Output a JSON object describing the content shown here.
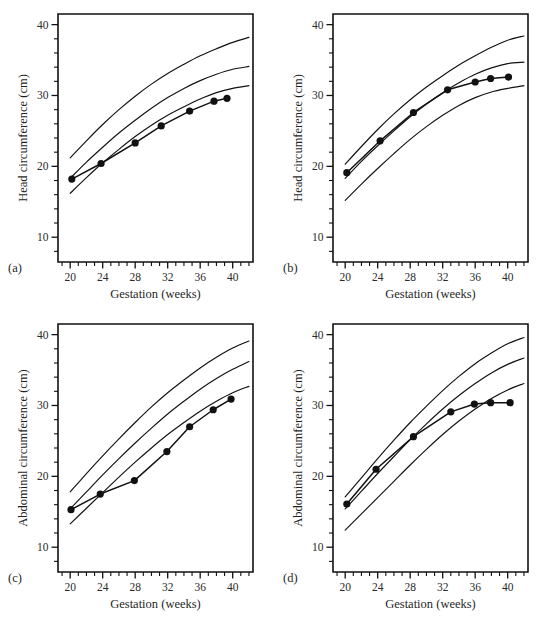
{
  "figure": {
    "background": "#ffffff",
    "ink_color": "#111111"
  },
  "axes": {
    "x_title": "Gestation (weeks)",
    "x_ticks": [
      20,
      24,
      28,
      32,
      36,
      40
    ],
    "x_min": 18.5,
    "x_max": 42.5,
    "y_ticks": [
      10,
      20,
      30,
      40
    ],
    "y_min": 6.5,
    "y_max": 41.5,
    "y_title_head": "Head circumference (cm)",
    "y_title_abdo": "Abdominal circumference (cm)"
  },
  "panels": [
    {
      "key": "a",
      "label": "(a)",
      "ylabel": "Head circumference (cm)",
      "xlabel": "Gestation (weeks)"
    },
    {
      "key": "b",
      "label": "(b)",
      "ylabel": "Head circumference (cm)",
      "xlabel": "Gestation (weeks)"
    },
    {
      "key": "c",
      "label": "(c)",
      "ylabel": "Abdominal circumference (cm)",
      "xlabel": "Gestation (weeks)"
    },
    {
      "key": "d",
      "label": "(d)",
      "ylabel": "Abdominal circumference (cm)",
      "xlabel": "Gestation (weeks)"
    }
  ],
  "chart_data": [
    {
      "type": "line",
      "panel": "a",
      "title": "(a)",
      "xlabel": "Gestation (weeks)",
      "ylabel": "Head circumference (cm)",
      "xlim": [
        18.5,
        42.5
      ],
      "ylim": [
        6.5,
        41.5
      ],
      "xticks": [
        20,
        24,
        28,
        32,
        36,
        40
      ],
      "yticks": [
        10,
        20,
        30,
        40
      ],
      "grid": false,
      "legend": "none",
      "series": [
        {
          "name": "upper centile",
          "kind": "reference-curve",
          "x": [
            20,
            22,
            24,
            26,
            28,
            30,
            32,
            34,
            36,
            38,
            40,
            42
          ],
          "values": [
            21.2,
            23.6,
            25.9,
            28.0,
            29.9,
            31.6,
            33.1,
            34.4,
            35.6,
            36.6,
            37.5,
            38.2
          ]
        },
        {
          "name": "middle centile",
          "kind": "reference-curve",
          "x": [
            20,
            22,
            24,
            26,
            28,
            30,
            32,
            34,
            36,
            38,
            40,
            42
          ],
          "values": [
            18.3,
            20.6,
            22.7,
            24.7,
            26.5,
            28.2,
            29.7,
            31.0,
            32.1,
            33.0,
            33.7,
            34.1
          ]
        },
        {
          "name": "lower centile",
          "kind": "reference-curve",
          "x": [
            20,
            22,
            24,
            26,
            28,
            30,
            32,
            34,
            36,
            38,
            40,
            42
          ],
          "values": [
            16.2,
            18.4,
            20.5,
            22.4,
            24.2,
            25.8,
            27.2,
            28.4,
            29.5,
            30.4,
            31.0,
            31.4
          ]
        },
        {
          "name": "measurements",
          "kind": "data-points",
          "x": [
            20.2,
            23.8,
            28.0,
            31.2,
            34.7,
            37.7,
            39.3
          ],
          "values": [
            18.2,
            20.4,
            23.3,
            25.7,
            27.8,
            29.2,
            29.6
          ]
        }
      ]
    },
    {
      "type": "line",
      "panel": "b",
      "title": "(b)",
      "xlabel": "Gestation (weeks)",
      "ylabel": "Head circumference (cm)",
      "xlim": [
        18.5,
        42.5
      ],
      "ylim": [
        6.5,
        41.5
      ],
      "xticks": [
        20,
        24,
        28,
        32,
        36,
        40
      ],
      "yticks": [
        10,
        20,
        30,
        40
      ],
      "grid": false,
      "legend": "none",
      "series": [
        {
          "name": "upper centile",
          "kind": "reference-curve",
          "x": [
            20,
            22,
            24,
            26,
            28,
            30,
            32,
            34,
            36,
            38,
            40,
            42
          ],
          "values": [
            20.3,
            22.8,
            25.2,
            27.4,
            29.4,
            31.2,
            32.8,
            34.3,
            35.6,
            36.8,
            37.8,
            38.4
          ]
        },
        {
          "name": "middle centile",
          "kind": "reference-curve",
          "x": [
            20,
            22,
            24,
            26,
            28,
            30,
            32,
            34,
            36,
            38,
            40,
            42
          ],
          "values": [
            18.3,
            20.7,
            22.9,
            25.0,
            27.0,
            28.8,
            30.4,
            31.8,
            33.0,
            33.9,
            34.5,
            34.7
          ]
        },
        {
          "name": "lower centile",
          "kind": "reference-curve",
          "x": [
            20,
            22,
            24,
            26,
            28,
            30,
            32,
            34,
            36,
            38,
            40,
            42
          ],
          "values": [
            15.2,
            17.5,
            19.7,
            21.8,
            23.8,
            25.6,
            27.2,
            28.6,
            29.7,
            30.5,
            31.0,
            31.4
          ]
        },
        {
          "name": "measurements",
          "kind": "data-points",
          "x": [
            20.2,
            24.3,
            28.4,
            32.6,
            36.0,
            37.9,
            40.1
          ],
          "values": [
            19.1,
            23.6,
            27.6,
            30.8,
            31.9,
            32.4,
            32.6
          ]
        }
      ]
    },
    {
      "type": "line",
      "panel": "c",
      "title": "(c)",
      "xlabel": "Gestation (weeks)",
      "ylabel": "Abdominal circumference (cm)",
      "xlim": [
        18.5,
        42.5
      ],
      "ylim": [
        6.5,
        41.5
      ],
      "xticks": [
        20,
        24,
        28,
        32,
        36,
        40
      ],
      "yticks": [
        10,
        20,
        30,
        40
      ],
      "grid": false,
      "legend": "none",
      "series": [
        {
          "name": "upper centile",
          "kind": "reference-curve",
          "x": [
            20,
            22,
            24,
            26,
            28,
            30,
            32,
            34,
            36,
            38,
            40,
            42
          ],
          "values": [
            17.8,
            20.4,
            22.9,
            25.3,
            27.6,
            29.8,
            31.8,
            33.6,
            35.3,
            36.8,
            38.1,
            39.1
          ]
        },
        {
          "name": "middle centile",
          "kind": "reference-curve",
          "x": [
            20,
            22,
            24,
            26,
            28,
            30,
            32,
            34,
            36,
            38,
            40,
            42
          ],
          "values": [
            15.4,
            17.8,
            20.2,
            22.5,
            24.7,
            26.8,
            28.8,
            30.6,
            32.3,
            33.8,
            35.1,
            36.2
          ]
        },
        {
          "name": "lower centile",
          "kind": "reference-curve",
          "x": [
            20,
            22,
            24,
            26,
            28,
            30,
            32,
            34,
            36,
            38,
            40,
            42
          ],
          "values": [
            13.3,
            15.5,
            17.7,
            19.9,
            22.0,
            24.0,
            25.9,
            27.6,
            29.2,
            30.6,
            31.8,
            32.7
          ]
        },
        {
          "name": "measurements",
          "kind": "data-points",
          "x": [
            20.1,
            23.7,
            27.9,
            31.9,
            34.7,
            37.6,
            39.8
          ],
          "values": [
            15.3,
            17.5,
            19.4,
            23.5,
            27.0,
            29.4,
            30.9
          ]
        }
      ]
    },
    {
      "type": "line",
      "panel": "d",
      "title": "(d)",
      "xlabel": "Gestation (weeks)",
      "ylabel": "Abdominal circumference (cm)",
      "xlim": [
        18.5,
        42.5
      ],
      "ylim": [
        6.5,
        41.5
      ],
      "xticks": [
        20,
        24,
        28,
        32,
        36,
        40
      ],
      "yticks": [
        10,
        20,
        30,
        40
      ],
      "grid": false,
      "legend": "none",
      "series": [
        {
          "name": "upper centile",
          "kind": "reference-curve",
          "x": [
            20,
            22,
            24,
            26,
            28,
            30,
            32,
            34,
            36,
            38,
            40,
            42
          ],
          "values": [
            17.1,
            19.8,
            22.5,
            25.1,
            27.6,
            29.9,
            32.1,
            34.1,
            35.9,
            37.4,
            38.7,
            39.6
          ]
        },
        {
          "name": "middle centile",
          "kind": "reference-curve",
          "x": [
            20,
            22,
            24,
            26,
            28,
            30,
            32,
            34,
            36,
            38,
            40,
            42
          ],
          "values": [
            15.4,
            17.9,
            20.4,
            22.8,
            25.2,
            27.4,
            29.5,
            31.4,
            33.1,
            34.6,
            35.8,
            36.7
          ]
        },
        {
          "name": "lower centile",
          "kind": "reference-curve",
          "x": [
            20,
            22,
            24,
            26,
            28,
            30,
            32,
            34,
            36,
            38,
            40,
            42
          ],
          "values": [
            12.4,
            14.7,
            17.0,
            19.3,
            21.6,
            23.8,
            25.9,
            27.8,
            29.5,
            31.0,
            32.2,
            33.1
          ]
        },
        {
          "name": "measurements",
          "kind": "data-points",
          "x": [
            20.2,
            23.8,
            28.4,
            33.0,
            35.9,
            37.9,
            40.3
          ],
          "values": [
            16.1,
            21.0,
            25.6,
            29.1,
            30.2,
            30.4,
            30.4
          ]
        }
      ]
    }
  ]
}
